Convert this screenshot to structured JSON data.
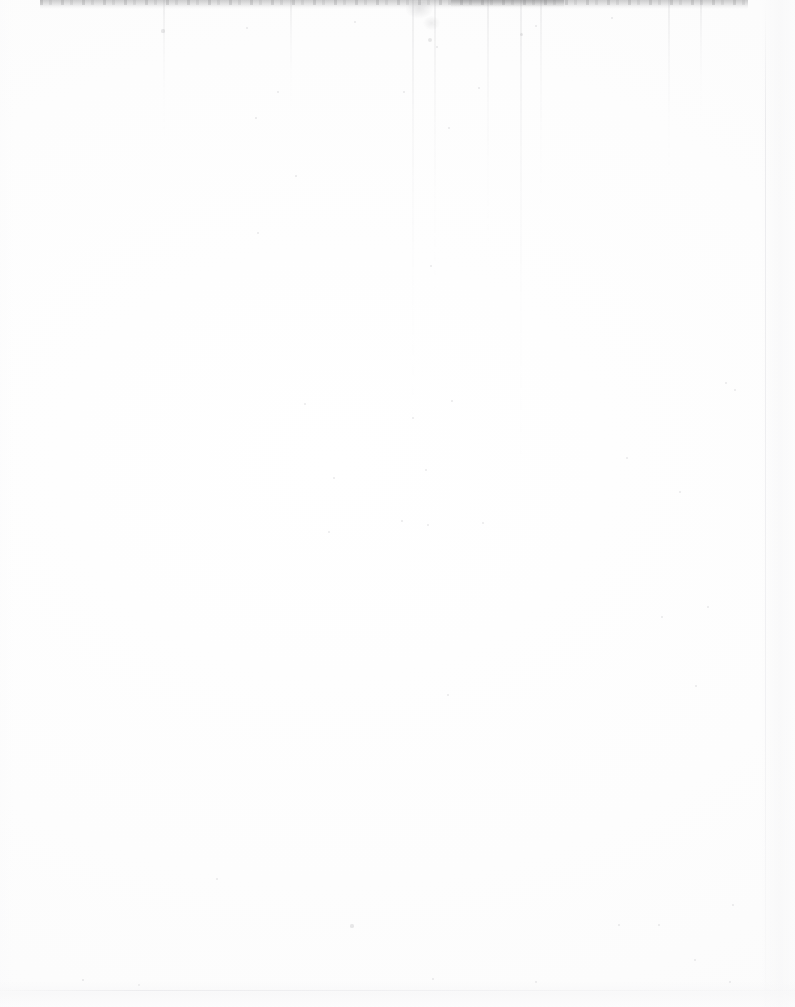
{
  "page": {
    "kind": "scanned-blank-page",
    "width": 795,
    "height": 1007,
    "visible_text": "",
    "description": "Blank scanned page: near-white paper with a dark smudge band along the top edge, faint vertical scanner streaks, scattered dust speckles, and subtle edge shading at right and bottom. No legible text or graphics."
  },
  "colors": {
    "paper": "#fefefe",
    "paper_tint": "#fbfbfb",
    "top_band": "#78787a",
    "streak": "#8c8c91",
    "edge_shadow": "#f6f6f7",
    "speck": "#78787e"
  },
  "artifacts": {
    "top_edge_band": {
      "label": "top-edge-scan-shadow",
      "x": 40,
      "y": 0,
      "width": 708,
      "height": 9
    },
    "top_smudge": {
      "label": "top-dust-smudge",
      "x": 403,
      "y": 2,
      "width": 46,
      "height": 34
    },
    "right_page_edge": {
      "label": "right-page-edge",
      "x": 765
    },
    "bottom_shadow": {
      "label": "bottom-edge-shadow",
      "y": 990
    },
    "streaks": [
      {
        "x": 412,
        "height": 430
      },
      {
        "x": 434,
        "height": 300
      },
      {
        "x": 487,
        "height": 250
      },
      {
        "x": 520,
        "height": 470
      },
      {
        "x": 540,
        "height": 210
      },
      {
        "x": 163,
        "height": 140
      },
      {
        "x": 290,
        "height": 110
      },
      {
        "x": 668,
        "height": 180
      },
      {
        "x": 700,
        "height": 120
      }
    ],
    "specks": [
      {
        "x": 163,
        "y": 31,
        "r": 1.6
      },
      {
        "x": 247,
        "y": 28,
        "r": 1.2
      },
      {
        "x": 355,
        "y": 22,
        "r": 1.4
      },
      {
        "x": 430,
        "y": 40,
        "r": 2.0
      },
      {
        "x": 437,
        "y": 47,
        "r": 1.3
      },
      {
        "x": 521,
        "y": 34,
        "r": 1.5
      },
      {
        "x": 536,
        "y": 26,
        "r": 1.1
      },
      {
        "x": 612,
        "y": 18,
        "r": 1.2
      },
      {
        "x": 404,
        "y": 92,
        "r": 1.0
      },
      {
        "x": 479,
        "y": 88,
        "r": 1.2
      },
      {
        "x": 278,
        "y": 92,
        "r": 1.0
      },
      {
        "x": 256,
        "y": 118,
        "r": 0.9
      },
      {
        "x": 449,
        "y": 128,
        "r": 1.1
      },
      {
        "x": 296,
        "y": 176,
        "r": 0.9
      },
      {
        "x": 258,
        "y": 233,
        "r": 1.0
      },
      {
        "x": 431,
        "y": 266,
        "r": 1.1
      },
      {
        "x": 726,
        "y": 383,
        "r": 1.2
      },
      {
        "x": 735,
        "y": 390,
        "r": 1.0
      },
      {
        "x": 305,
        "y": 404,
        "r": 1.0
      },
      {
        "x": 452,
        "y": 401,
        "r": 0.9
      },
      {
        "x": 413,
        "y": 418,
        "r": 1.0
      },
      {
        "x": 426,
        "y": 470,
        "r": 1.0
      },
      {
        "x": 334,
        "y": 478,
        "r": 1.1
      },
      {
        "x": 680,
        "y": 492,
        "r": 1.3
      },
      {
        "x": 627,
        "y": 458,
        "r": 1.0
      },
      {
        "x": 402,
        "y": 521,
        "r": 0.9
      },
      {
        "x": 428,
        "y": 525,
        "r": 1.0
      },
      {
        "x": 329,
        "y": 532,
        "r": 1.0
      },
      {
        "x": 483,
        "y": 523,
        "r": 1.0
      },
      {
        "x": 708,
        "y": 607,
        "r": 1.1
      },
      {
        "x": 662,
        "y": 617,
        "r": 1.0
      },
      {
        "x": 696,
        "y": 686,
        "r": 1.2
      },
      {
        "x": 448,
        "y": 695,
        "r": 1.0
      },
      {
        "x": 217,
        "y": 879,
        "r": 1.3
      },
      {
        "x": 352,
        "y": 926,
        "r": 1.6
      },
      {
        "x": 659,
        "y": 925,
        "r": 1.4
      },
      {
        "x": 733,
        "y": 905,
        "r": 1.1
      },
      {
        "x": 695,
        "y": 960,
        "r": 1.0
      },
      {
        "x": 619,
        "y": 925,
        "r": 1.0
      },
      {
        "x": 139,
        "y": 985,
        "r": 1.0
      },
      {
        "x": 83,
        "y": 980,
        "r": 0.9
      },
      {
        "x": 536,
        "y": 982,
        "r": 1.0
      },
      {
        "x": 433,
        "y": 979,
        "r": 1.0
      },
      {
        "x": 730,
        "y": 982,
        "r": 1.2
      }
    ]
  }
}
